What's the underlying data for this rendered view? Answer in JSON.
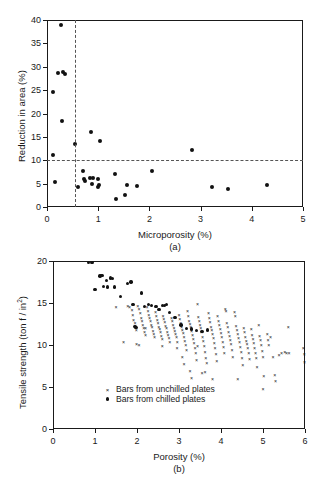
{
  "figure": {
    "panel_a_label": "(a)",
    "panel_b_label": "(b)"
  },
  "chart_data": [
    {
      "type": "scatter",
      "id": "panel-a",
      "title": "",
      "xlabel": "Microporosity (%)",
      "ylabel": "Reduction in area (%)",
      "xlim": [
        0,
        5
      ],
      "ylim": [
        0,
        40
      ],
      "xticks": [
        0,
        1,
        2,
        3,
        4,
        5
      ],
      "yticks": [
        0,
        5,
        10,
        15,
        20,
        25,
        30,
        35,
        40
      ],
      "grid": false,
      "legend": null,
      "annotations": [
        {
          "kind": "vline",
          "value": 0.55,
          "style": "dashed",
          "color": "#555555"
        },
        {
          "kind": "hline",
          "value": 10,
          "style": "dashed",
          "color": "#555555"
        }
      ],
      "series": [
        {
          "name": "Reduction in area",
          "marker": "dot",
          "points": [
            [
              0.27,
              39.0
            ],
            [
              0.21,
              28.7
            ],
            [
              0.32,
              28.8
            ],
            [
              0.35,
              28.4
            ],
            [
              0.12,
              24.6
            ],
            [
              0.29,
              18.3
            ],
            [
              0.55,
              13.4
            ],
            [
              0.12,
              11.2
            ],
            [
              0.86,
              16.0
            ],
            [
              1.03,
              14.2
            ],
            [
              2.84,
              12.2
            ],
            [
              0.15,
              5.3
            ],
            [
              0.6,
              4.3
            ],
            [
              0.7,
              7.6
            ],
            [
              0.72,
              5.9
            ],
            [
              0.74,
              5.5
            ],
            [
              0.84,
              6.2
            ],
            [
              0.9,
              6.1
            ],
            [
              0.88,
              5.0
            ],
            [
              1.0,
              4.2
            ],
            [
              0.99,
              5.9
            ],
            [
              1.02,
              4.7
            ],
            [
              1.33,
              7.1
            ],
            [
              1.35,
              1.8
            ],
            [
              1.52,
              2.5
            ],
            [
              1.57,
              4.8
            ],
            [
              1.76,
              4.5
            ],
            [
              2.06,
              7.6
            ],
            [
              3.22,
              4.2
            ],
            [
              3.54,
              3.8
            ],
            [
              4.29,
              4.7
            ]
          ]
        }
      ]
    },
    {
      "type": "scatter",
      "id": "panel-b",
      "title": "",
      "xlabel": "Porosity (%)",
      "ylabel": "Tensile strength (ton f / in2)",
      "ylabel_sup": "2",
      "ylabel_base": "Tensile strength (ton f / in",
      "ylabel_tail": ")",
      "xlim": [
        0,
        6
      ],
      "ylim": [
        0,
        20
      ],
      "xticks": [
        0,
        1,
        2,
        3,
        4,
        5,
        6
      ],
      "yticks": [
        0,
        5,
        10,
        15,
        20
      ],
      "grid": false,
      "legend": {
        "position": "lower-center",
        "entries": [
          {
            "marker": "x",
            "label": "Bars from unchilled plates"
          },
          {
            "marker": "dot",
            "label": "Bars from chilled plates"
          }
        ]
      },
      "series": [
        {
          "name": "Bars from chilled plates",
          "marker": "dot",
          "points": [
            [
              0.84,
              19.8
            ],
            [
              0.93,
              19.8
            ],
            [
              1.0,
              16.6
            ],
            [
              1.12,
              18.2
            ],
            [
              1.17,
              18.3
            ],
            [
              1.2,
              17.0
            ],
            [
              1.28,
              17.7
            ],
            [
              1.3,
              16.9
            ],
            [
              1.37,
              18.0
            ],
            [
              1.42,
              17.9
            ],
            [
              1.47,
              16.9
            ],
            [
              1.6,
              15.8
            ],
            [
              1.78,
              17.3
            ],
            [
              1.86,
              17.5
            ],
            [
              1.9,
              14.8
            ],
            [
              1.95,
              12.2
            ],
            [
              1.98,
              12.1
            ],
            [
              2.1,
              16.2
            ],
            [
              2.18,
              14.6
            ],
            [
              2.28,
              14.8
            ],
            [
              2.35,
              14.7
            ],
            [
              2.45,
              14.6
            ],
            [
              2.52,
              14.2
            ],
            [
              2.6,
              14.7
            ],
            [
              2.66,
              14.7
            ],
            [
              2.7,
              14.8
            ],
            [
              2.78,
              13.9
            ],
            [
              2.9,
              13.3
            ],
            [
              3.05,
              12.4
            ],
            [
              3.18,
              12.0
            ],
            [
              3.3,
              11.9
            ],
            [
              3.42,
              11.7
            ],
            [
              3.55,
              11.6
            ],
            [
              3.68,
              11.8
            ]
          ]
        },
        {
          "name": "Bars from unchilled plates",
          "marker": "x",
          "points": [
            [
              1.5,
              14.5
            ],
            [
              1.68,
              10.4
            ],
            [
              1.78,
              14.6
            ],
            [
              1.82,
              14.5
            ],
            [
              1.88,
              14.2
            ],
            [
              1.9,
              13.6
            ],
            [
              1.92,
              13.0
            ],
            [
              1.95,
              12.6
            ],
            [
              1.96,
              12.2
            ],
            [
              1.98,
              11.8
            ],
            [
              1.99,
              10.1
            ],
            [
              2.02,
              14.6
            ],
            [
              2.05,
              14.3
            ],
            [
              2.08,
              13.8
            ],
            [
              2.1,
              13.2
            ],
            [
              2.12,
              12.9
            ],
            [
              2.14,
              12.4
            ],
            [
              2.16,
              12.0
            ],
            [
              2.18,
              11.6
            ],
            [
              2.2,
              11.2
            ],
            [
              2.24,
              14.5
            ],
            [
              2.26,
              14.1
            ],
            [
              2.28,
              13.6
            ],
            [
              2.3,
              13.2
            ],
            [
              2.32,
              12.8
            ],
            [
              2.34,
              12.4
            ],
            [
              2.36,
              12.1
            ],
            [
              2.38,
              11.7
            ],
            [
              2.4,
              11.3
            ],
            [
              2.42,
              10.9
            ],
            [
              2.44,
              13.9
            ],
            [
              2.46,
              13.4
            ],
            [
              2.48,
              13.0
            ],
            [
              2.5,
              12.6
            ],
            [
              2.52,
              12.2
            ],
            [
              2.54,
              11.9
            ],
            [
              2.56,
              11.5
            ],
            [
              2.58,
              11.1
            ],
            [
              2.6,
              10.7
            ],
            [
              2.62,
              13.5
            ],
            [
              2.64,
              13.1
            ],
            [
              2.66,
              12.7
            ],
            [
              2.68,
              12.3
            ],
            [
              2.7,
              12.0
            ],
            [
              2.72,
              11.6
            ],
            [
              2.74,
              11.2
            ],
            [
              2.76,
              10.8
            ],
            [
              2.78,
              10.3
            ],
            [
              2.82,
              13.2
            ],
            [
              2.84,
              12.8
            ],
            [
              2.86,
              12.4
            ],
            [
              2.88,
              12.0
            ],
            [
              2.9,
              11.7
            ],
            [
              2.92,
              11.3
            ],
            [
              2.94,
              10.9
            ],
            [
              2.96,
              10.4
            ],
            [
              3.0,
              13.6
            ],
            [
              3.02,
              13.1
            ],
            [
              3.04,
              12.6
            ],
            [
              3.06,
              12.2
            ],
            [
              3.08,
              11.8
            ],
            [
              3.1,
              11.4
            ],
            [
              3.12,
              11.0
            ],
            [
              3.14,
              10.5
            ],
            [
              3.16,
              10.0
            ],
            [
              3.18,
              9.4
            ],
            [
              3.2,
              14.0
            ],
            [
              3.22,
              13.4
            ],
            [
              3.24,
              12.9
            ],
            [
              3.26,
              12.5
            ],
            [
              3.28,
              12.1
            ],
            [
              3.3,
              11.7
            ],
            [
              3.32,
              11.2
            ],
            [
              3.34,
              10.7
            ],
            [
              3.36,
              10.2
            ],
            [
              3.38,
              9.6
            ],
            [
              3.4,
              9.0
            ],
            [
              3.42,
              8.2
            ],
            [
              3.44,
              14.9
            ],
            [
              3.46,
              13.3
            ],
            [
              3.48,
              12.8
            ],
            [
              3.5,
              12.4
            ],
            [
              3.52,
              12.0
            ],
            [
              3.54,
              11.5
            ],
            [
              3.56,
              11.0
            ],
            [
              3.58,
              10.5
            ],
            [
              3.6,
              9.9
            ],
            [
              3.62,
              9.2
            ],
            [
              3.64,
              8.5
            ],
            [
              3.66,
              7.8
            ],
            [
              3.12,
              7.7
            ],
            [
              3.26,
              6.9
            ],
            [
              3.3,
              6.1
            ],
            [
              3.55,
              6.7
            ],
            [
              3.62,
              6.8
            ],
            [
              3.7,
              13.8
            ],
            [
              3.72,
              13.2
            ],
            [
              3.74,
              12.7
            ],
            [
              3.76,
              12.2
            ],
            [
              3.78,
              11.8
            ],
            [
              3.8,
              11.3
            ],
            [
              3.82,
              10.8
            ],
            [
              3.84,
              10.2
            ],
            [
              3.86,
              9.6
            ],
            [
              3.88,
              8.9
            ],
            [
              3.9,
              8.1
            ],
            [
              3.8,
              6.0
            ],
            [
              3.92,
              13.5
            ],
            [
              3.94,
              12.9
            ],
            [
              3.96,
              12.4
            ],
            [
              3.98,
              11.9
            ],
            [
              4.0,
              11.4
            ],
            [
              4.02,
              10.9
            ],
            [
              4.04,
              10.4
            ],
            [
              4.06,
              9.8
            ],
            [
              4.08,
              9.1
            ],
            [
              4.1,
              14.3
            ],
            [
              4.12,
              14.0
            ],
            [
              4.14,
              12.6
            ],
            [
              4.16,
              12.1
            ],
            [
              4.18,
              11.6
            ],
            [
              4.2,
              11.1
            ],
            [
              4.22,
              10.6
            ],
            [
              4.24,
              10.1
            ],
            [
              4.26,
              9.4
            ],
            [
              4.28,
              8.6
            ],
            [
              4.32,
              13.9
            ],
            [
              4.34,
              13.5
            ],
            [
              4.36,
              12.3
            ],
            [
              4.38,
              11.8
            ],
            [
              4.4,
              11.3
            ],
            [
              4.42,
              10.8
            ],
            [
              4.44,
              10.3
            ],
            [
              4.46,
              9.8
            ],
            [
              4.48,
              9.2
            ],
            [
              4.5,
              8.4
            ],
            [
              4.52,
              7.6
            ],
            [
              4.4,
              6.0
            ],
            [
              4.54,
              12.0
            ],
            [
              4.56,
              11.5
            ],
            [
              4.58,
              11.0
            ],
            [
              4.6,
              10.5
            ],
            [
              4.62,
              10.1
            ],
            [
              4.64,
              9.6
            ],
            [
              4.66,
              9.0
            ],
            [
              4.68,
              8.3
            ],
            [
              4.72,
              11.9
            ],
            [
              4.74,
              11.2
            ],
            [
              4.76,
              10.7
            ],
            [
              4.78,
              10.2
            ],
            [
              4.8,
              9.7
            ],
            [
              4.82,
              9.1
            ],
            [
              4.84,
              8.5
            ],
            [
              4.86,
              7.4
            ],
            [
              4.9,
              12.4
            ],
            [
              4.92,
              11.1
            ],
            [
              4.94,
              10.6
            ],
            [
              4.96,
              10.0
            ],
            [
              4.98,
              9.3
            ],
            [
              5.0,
              8.6
            ],
            [
              5.02,
              6.3
            ],
            [
              5.0,
              4.8
            ],
            [
              5.1,
              11.3
            ],
            [
              5.12,
              10.6
            ],
            [
              5.14,
              10.0
            ],
            [
              5.18,
              11.0
            ],
            [
              5.24,
              8.6
            ],
            [
              5.28,
              6.4
            ],
            [
              5.3,
              5.7
            ],
            [
              5.38,
              8.8
            ],
            [
              5.44,
              9.0
            ],
            [
              5.52,
              9.2
            ],
            [
              5.56,
              9.1
            ],
            [
              5.6,
              12.1
            ],
            [
              5.62,
              9.1
            ],
            [
              5.96,
              9.6
            ],
            [
              5.98,
              8.9
            ],
            [
              5.99,
              8.0
            ],
            [
              2.05,
              10.0
            ],
            [
              2.2,
              12.0
            ],
            [
              2.6,
              9.9
            ],
            [
              2.95,
              9.7
            ],
            [
              3.08,
              8.6
            ],
            [
              3.44,
              9.9
            ]
          ]
        }
      ]
    }
  ]
}
